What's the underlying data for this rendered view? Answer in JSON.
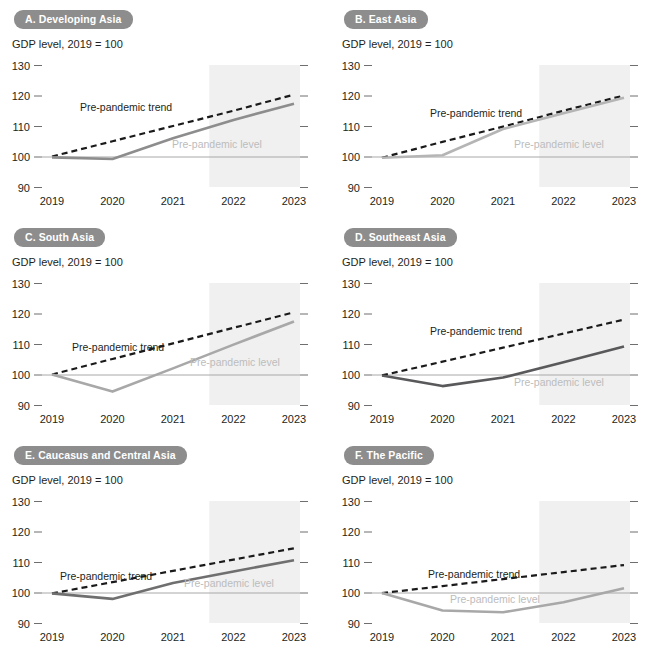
{
  "figure": {
    "axis_note": "GDP level, 2019 = 100",
    "y_ticks": [
      130,
      120,
      110,
      100,
      90
    ],
    "x_ticks": [
      "2019",
      "2020",
      "2021",
      "2022",
      "2023"
    ],
    "annotation_trend": "Pre-pandemic trend",
    "annotation_level": "Pre-pandemic level",
    "badge_color": "#8d8d8d",
    "forecast_band_color": "#f0f0f0",
    "trend_line_color": "#1a1a1a",
    "baseline_color": "#a8a8a8",
    "forecast_start": "2021.6"
  },
  "chart_data": [
    {
      "type": "line",
      "panel_id": "A",
      "title": "A. Developing Asia",
      "ylabel": "GDP level, 2019 = 100",
      "xlabel": "",
      "ylim": [
        85,
        133
      ],
      "x": [
        "2019",
        "2020",
        "2021",
        "2022",
        "2023"
      ],
      "grid": false,
      "legend": "inline-annotations",
      "series": [
        {
          "name": "Pre-pandemic trend",
          "style": "dashed",
          "color": "#1a1a1a",
          "values": [
            100,
            105,
            110,
            115,
            120.3
          ]
        },
        {
          "name": "GDP level",
          "style": "solid",
          "color": "#8d8d8d",
          "values": [
            99.7,
            99.2,
            106.0,
            112.0,
            117.3
          ]
        }
      ],
      "reference_line": {
        "label": "Pre-pandemic level",
        "value": 100
      }
    },
    {
      "type": "line",
      "panel_id": "B",
      "title": "B. East Asia",
      "ylabel": "GDP level, 2019 = 100",
      "xlabel": "",
      "ylim": [
        85,
        133
      ],
      "x": [
        "2019",
        "2020",
        "2021",
        "2022",
        "2023"
      ],
      "grid": false,
      "legend": "inline-annotations",
      "series": [
        {
          "name": "Pre-pandemic trend",
          "style": "dashed",
          "color": "#1a1a1a",
          "values": [
            99.6,
            104.8,
            109.8,
            115.0,
            120.0
          ]
        },
        {
          "name": "GDP level",
          "style": "solid",
          "color": "#b5b5b5",
          "values": [
            99.6,
            100.4,
            109.0,
            114.2,
            119.3
          ]
        }
      ],
      "reference_line": {
        "label": "Pre-pandemic level",
        "value": 100
      }
    },
    {
      "type": "line",
      "panel_id": "C",
      "title": "C. South Asia",
      "ylabel": "GDP level, 2019 = 100",
      "xlabel": "",
      "ylim": [
        85,
        133
      ],
      "x": [
        "2019",
        "2020",
        "2021",
        "2022",
        "2023"
      ],
      "grid": false,
      "legend": "inline-annotations",
      "series": [
        {
          "name": "Pre-pandemic trend",
          "style": "dashed",
          "color": "#1a1a1a",
          "values": [
            100,
            105.1,
            110.2,
            115.3,
            120.4
          ]
        },
        {
          "name": "GDP level",
          "style": "solid",
          "color": "#a8a8a8",
          "values": [
            100,
            94.4,
            102.0,
            109.8,
            117.4
          ]
        }
      ],
      "reference_line": {
        "label": "Pre-pandemic level",
        "value": 100
      }
    },
    {
      "type": "line",
      "panel_id": "D",
      "title": "D. Southeast Asia",
      "ylabel": "GDP level, 2019 = 100",
      "xlabel": "",
      "ylim": [
        85,
        133
      ],
      "x": [
        "2019",
        "2020",
        "2021",
        "2022",
        "2023"
      ],
      "grid": false,
      "legend": "inline-annotations",
      "series": [
        {
          "name": "Pre-pandemic trend",
          "style": "dashed",
          "color": "#1a1a1a",
          "values": [
            99.7,
            104.2,
            108.8,
            113.4,
            118.0
          ]
        },
        {
          "name": "GDP level",
          "style": "solid",
          "color": "#59595b",
          "values": [
            99.7,
            96.2,
            99.0,
            104.0,
            109.2
          ]
        }
      ],
      "reference_line": {
        "label": "Pre-pandemic level",
        "value": 100
      }
    },
    {
      "type": "line",
      "panel_id": "E",
      "title": "E. Caucasus and Central Asia",
      "ylabel": "GDP level, 2019 = 100",
      "xlabel": "",
      "ylim": [
        85,
        133
      ],
      "x": [
        "2019",
        "2020",
        "2021",
        "2022",
        "2023"
      ],
      "grid": false,
      "legend": "inline-annotations",
      "series": [
        {
          "name": "Pre-pandemic trend",
          "style": "dashed",
          "color": "#1a1a1a",
          "values": [
            99.7,
            103.4,
            107.1,
            110.8,
            114.5
          ]
        },
        {
          "name": "GDP level",
          "style": "solid",
          "color": "#6f6f6f",
          "values": [
            99.7,
            97.9,
            103.1,
            106.9,
            110.6
          ]
        }
      ],
      "reference_line": {
        "label": "Pre-pandemic level",
        "value": 100
      }
    },
    {
      "type": "line",
      "panel_id": "F",
      "title": "F. The Pacific",
      "ylabel": "GDP level, 2019 = 100",
      "xlabel": "",
      "ylim": [
        85,
        133
      ],
      "x": [
        "2019",
        "2020",
        "2021",
        "2022",
        "2023"
      ],
      "grid": false,
      "legend": "inline-annotations",
      "series": [
        {
          "name": "Pre-pandemic trend",
          "style": "dashed",
          "color": "#1a1a1a",
          "values": [
            99.8,
            102.1,
            104.4,
            106.7,
            109.0
          ]
        },
        {
          "name": "GDP level",
          "style": "solid",
          "color": "#a8a8a8",
          "values": [
            99.8,
            94.1,
            93.5,
            96.8,
            101.4
          ]
        }
      ],
      "reference_line": {
        "label": "Pre-pandemic level",
        "value": 100
      }
    }
  ],
  "panel_annotation_positions": [
    {
      "panel_id": "A",
      "trend": {
        "x": 68,
        "y": 56
      },
      "level": {
        "x": 160,
        "y": 93
      }
    },
    {
      "panel_id": "B",
      "trend": {
        "x": 88,
        "y": 62
      },
      "level": {
        "x": 172,
        "y": 93
      }
    },
    {
      "panel_id": "C",
      "trend": {
        "x": 60,
        "y": 78
      },
      "level": {
        "x": 178,
        "y": 93
      }
    },
    {
      "panel_id": "D",
      "trend": {
        "x": 88,
        "y": 62
      },
      "level": {
        "x": 172,
        "y": 113
      }
    },
    {
      "panel_id": "E",
      "trend": {
        "x": 48,
        "y": 89
      },
      "level": {
        "x": 172,
        "y": 96
      }
    },
    {
      "panel_id": "F",
      "trend": {
        "x": 86,
        "y": 87
      },
      "level": {
        "x": 108,
        "y": 112
      }
    }
  ]
}
